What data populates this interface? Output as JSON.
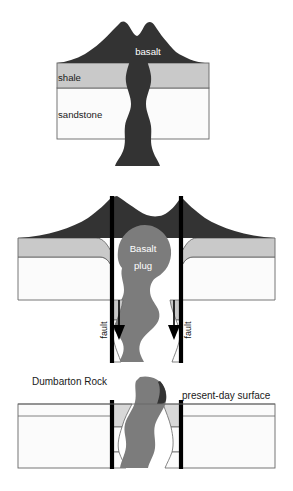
{
  "figure": {
    "width": 293,
    "height": 491,
    "background": "#ffffff"
  },
  "palette": {
    "basalt_dark": "#333333",
    "basalt_plug_gray": "#7c7c7c",
    "shale_gray": "#c9c9c9",
    "sandstone_white": "#fbfbfb",
    "outline": "#555555",
    "fault_black": "#000000",
    "label_dark": "#1a1a1a",
    "label_light": "#ffffff"
  },
  "panels": [
    {
      "id": "panel-1-volcano",
      "name": "stage-1-active-volcano",
      "labels": [
        {
          "id": "basalt",
          "text": "basalt",
          "x": 148,
          "y": 52,
          "tone": "light"
        },
        {
          "id": "shale",
          "text": "shale",
          "x": 58,
          "y": 78,
          "tone": "dark"
        },
        {
          "id": "sandstone",
          "text": "sandstone",
          "x": 58,
          "y": 115,
          "tone": "dark"
        }
      ]
    },
    {
      "id": "panel-2-erosion-faulting",
      "name": "stage-2-faulting-and-plug",
      "labels": [
        {
          "id": "basalt-plug-line-1",
          "text": "Basalt",
          "x": 142,
          "y": 248,
          "tone": "light"
        },
        {
          "id": "basalt-plug-line-2",
          "text": "plug",
          "x": 142,
          "y": 265,
          "tone": "light"
        },
        {
          "id": "fault-left",
          "text": "fault",
          "x": 106,
          "y": 330,
          "tone": "dark",
          "rotated": true
        },
        {
          "id": "fault-right",
          "text": "fault",
          "x": 180,
          "y": 330,
          "tone": "dark",
          "rotated": true
        }
      ]
    },
    {
      "id": "panel-3-present-day",
      "name": "stage-3-present-day",
      "labels": [
        {
          "id": "dumbarton-rock",
          "text": "Dumbarton Rock",
          "x": 32,
          "y": 381,
          "tone": "dark"
        },
        {
          "id": "present-day-surface",
          "text": "present-day surface",
          "x": 182,
          "y": 396,
          "tone": "dark"
        }
      ]
    }
  ],
  "legend_terms": {
    "basalt": "basalt",
    "shale": "shale",
    "sandstone": "sandstone",
    "basalt_plug": "Basalt plug",
    "fault": "fault",
    "dumbarton_rock": "Dumbarton Rock",
    "present_day_surface": "present-day surface"
  }
}
